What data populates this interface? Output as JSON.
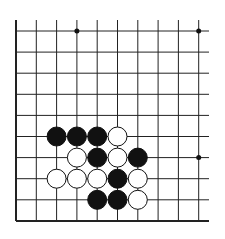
{
  "board": {
    "cols": 10,
    "rows": 10,
    "origin_x": 16,
    "origin_y": 31,
    "spacing_x": 20.3,
    "spacing_y": 21.1,
    "line_top": 20,
    "line_right": 209,
    "line_color": "#222222",
    "edge_left": true,
    "edge_bottom": true,
    "stone_radius": 9.5
  },
  "star_points": [
    {
      "col": 3,
      "row": 0
    },
    {
      "col": 9,
      "row": 0
    },
    {
      "col": 9,
      "row": 6
    }
  ],
  "stones": [
    {
      "col": 2,
      "row": 5,
      "color": "black"
    },
    {
      "col": 3,
      "row": 5,
      "color": "black"
    },
    {
      "col": 4,
      "row": 5,
      "color": "black"
    },
    {
      "col": 5,
      "row": 5,
      "color": "white"
    },
    {
      "col": 3,
      "row": 6,
      "color": "white"
    },
    {
      "col": 4,
      "row": 6,
      "color": "black"
    },
    {
      "col": 5,
      "row": 6,
      "color": "white"
    },
    {
      "col": 6,
      "row": 6,
      "color": "black"
    },
    {
      "col": 2,
      "row": 7,
      "color": "white"
    },
    {
      "col": 3,
      "row": 7,
      "color": "white"
    },
    {
      "col": 4,
      "row": 7,
      "color": "white"
    },
    {
      "col": 5,
      "row": 7,
      "color": "black"
    },
    {
      "col": 6,
      "row": 7,
      "color": "white"
    },
    {
      "col": 4,
      "row": 8,
      "color": "black"
    },
    {
      "col": 5,
      "row": 8,
      "color": "black"
    },
    {
      "col": 6,
      "row": 8,
      "color": "white"
    }
  ]
}
